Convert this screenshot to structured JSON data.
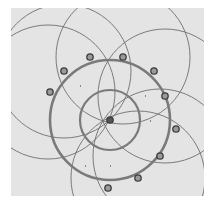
{
  "figure": {
    "background": "#e4e4e4",
    "line_color": "#6e6e6e",
    "thick_color": "#7a7a7a",
    "marker_fill": "#9a9a9a",
    "marker_stroke": "#3c3c3c",
    "center": {
      "x": 110,
      "y": 120
    },
    "main_circle": {
      "r": 60
    },
    "inner_circle": {
      "r": 30
    },
    "thin_circles": [
      {
        "cx": 64,
        "cy": 71,
        "r": 67
      },
      {
        "cx": 123,
        "cy": 57,
        "r": 67
      },
      {
        "cx": 165,
        "cy": 96,
        "r": 67
      },
      {
        "cx": 48,
        "cy": 92,
        "r": 67
      },
      {
        "cx": 160,
        "cy": 156,
        "r": 67
      },
      {
        "cx": 138,
        "cy": 178,
        "r": 67
      }
    ],
    "markers": [
      {
        "x": 90,
        "y": 57
      },
      {
        "x": 123,
        "y": 57
      },
      {
        "x": 154,
        "y": 71
      },
      {
        "x": 64,
        "y": 71
      },
      {
        "x": 50,
        "y": 92
      },
      {
        "x": 165,
        "y": 96
      },
      {
        "x": 176,
        "y": 129
      },
      {
        "x": 160,
        "y": 156
      },
      {
        "x": 138,
        "y": 178
      },
      {
        "x": 108,
        "y": 188
      },
      {
        "x": 110,
        "y": 120
      }
    ],
    "specks": [
      {
        "x": 80,
        "y": 85
      },
      {
        "x": 150,
        "y": 120
      },
      {
        "x": 110,
        "y": 165
      },
      {
        "x": 85,
        "y": 165
      },
      {
        "x": 145,
        "y": 95
      }
    ]
  }
}
